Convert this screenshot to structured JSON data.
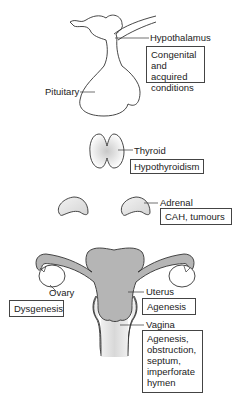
{
  "figure": {
    "top_cut_text": "(e.g. ... )",
    "organs": [
      {
        "id": "hypothalamus",
        "label": "Hypothalamus",
        "conditions": [
          "Congenital",
          "and acquired",
          "conditions"
        ]
      },
      {
        "id": "pituitary",
        "label": "Pituitary"
      },
      {
        "id": "thyroid",
        "label": "Thyroid",
        "conditions": [
          "Hypothyroidism"
        ]
      },
      {
        "id": "adrenal",
        "label": "Adrenal",
        "conditions": [
          "CAH, tumours"
        ]
      },
      {
        "id": "ovary",
        "label": "Ovary",
        "conditions": [
          "Dysgenesis"
        ]
      },
      {
        "id": "uterus",
        "label": "Uterus",
        "conditions": [
          "Agenesis"
        ]
      },
      {
        "id": "vagina",
        "label": "Vagina",
        "conditions": [
          "Agenesis,",
          "obstruction,",
          "septum,",
          "imperforate",
          "hymen"
        ]
      }
    ],
    "colors": {
      "line": "#333333",
      "fill_gray": "#b5b5b5",
      "fill_light": "#e2e2e2",
      "box_border": "#444444"
    }
  }
}
